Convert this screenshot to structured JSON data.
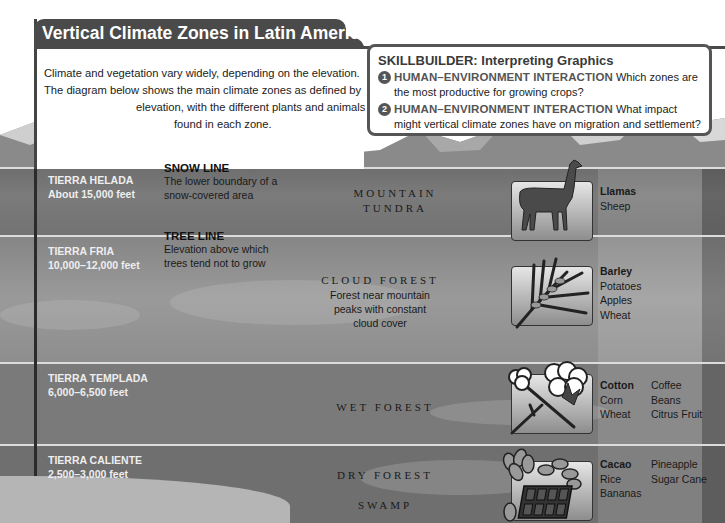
{
  "title": "Vertical Climate Zones in Latin America",
  "intro": {
    "lines": [
      "Climate and vegetation vary widely, depending on the elevation.",
      "The diagram below shows the main climate zones as defined by",
      "elevation, with the different plants and animals",
      "found in each zone."
    ]
  },
  "skillbuilder": {
    "title": "SKILLBUILDER: Interpreting Graphics",
    "questions": [
      {
        "number": "1",
        "category": "HUMAN–ENVIRONMENT INTERACTION",
        "text_line1": "Which zones are",
        "text_line2": "the most productive for growing crops?"
      },
      {
        "number": "2",
        "category": "HUMAN–ENVIRONMENT INTERACTION",
        "text_line1": "What impact",
        "text_line2": "might vertical climate zones have on migration and settlement?"
      }
    ]
  },
  "boundaries": [
    {
      "title": "SNOW LINE",
      "desc_line1": "The lower boundary of a",
      "desc_line2": "snow-covered area"
    },
    {
      "title": "TREE LINE",
      "desc_line1": "Elevation above which",
      "desc_line2": "trees tend not to grow"
    }
  ],
  "zones": [
    {
      "name": "TIERRA HELADA",
      "elevation": "About 15,000 feet",
      "vegetation": [
        "MOUNTAIN",
        "TUNDRA"
      ],
      "icon": "llama-icon",
      "produce_col1": [
        {
          "label": "Llamas",
          "bold": true
        },
        {
          "label": "Sheep"
        }
      ],
      "produce_col2": []
    },
    {
      "name": "TIERRA FRIA",
      "elevation": "10,000–12,000 feet",
      "vegetation": [
        "CLOUD FOREST"
      ],
      "vegetation_desc": [
        "Forest near mountain",
        "peaks with constant",
        "cloud cover"
      ],
      "icon": "wheat-icon",
      "produce_col1": [
        {
          "label": "Barley",
          "bold": true
        },
        {
          "label": "Potatoes"
        },
        {
          "label": "Apples"
        },
        {
          "label": "Wheat"
        }
      ],
      "produce_col2": []
    },
    {
      "name": "TIERRA TEMPLADA",
      "elevation": "6,000–6,500 feet",
      "vegetation": [
        "WET FOREST"
      ],
      "icon": "cotton-icon",
      "produce_col1": [
        {
          "label": "Cotton",
          "bold": true
        },
        {
          "label": "Corn"
        },
        {
          "label": "Wheat"
        }
      ],
      "produce_col2": [
        {
          "label": "Coffee"
        },
        {
          "label": "Beans"
        },
        {
          "label": "Citrus Fruit"
        }
      ]
    },
    {
      "name": "TIERRA CALIENTE",
      "elevation": "2,500–3,000 feet",
      "vegetation": [
        "DRY FOREST",
        "SWAMP"
      ],
      "icon": "cacao-chocolate-icon",
      "produce_col1": [
        {
          "label": "Cacao",
          "bold": true
        },
        {
          "label": "Rice"
        },
        {
          "label": "Bananas"
        }
      ],
      "produce_col2": [
        {
          "label": "Pineapple"
        },
        {
          "label": "Sugar Cane"
        }
      ]
    }
  ],
  "colors": {
    "title_bar": "#4a4a4a",
    "zone_label": "#eeeeee",
    "divider": "#dcdcdc"
  }
}
